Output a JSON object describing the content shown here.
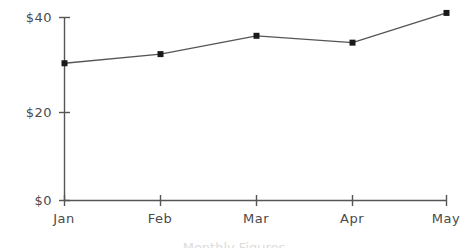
{
  "chart_data": {
    "type": "line",
    "title": "",
    "subtitle": "",
    "xlabel": "",
    "ylabel": "",
    "categories": [
      "Jan",
      "Feb",
      "Mar",
      "Apr",
      "May"
    ],
    "values": [
      30,
      32,
      36,
      34.5,
      41
    ],
    "series": [
      {
        "name": "",
        "values": [
          30,
          32,
          36,
          34.5,
          41
        ]
      }
    ],
    "ylim": [
      0,
      44
    ],
    "y_ticks": [
      0,
      20,
      40
    ],
    "y_tick_labels": [
      "$0",
      "$20",
      "$40"
    ],
    "x_tick_labels": [
      "Jan",
      "Feb",
      "Mar",
      "Apr",
      "May"
    ],
    "grid": false,
    "legend": false,
    "legend_position": "none",
    "marker": "square",
    "line_color": "#555555",
    "marker_color": "#1a1a1a",
    "axis_color": "#555555",
    "text_color": "#4a4a4a",
    "background_color": "#ffffff",
    "annotations": []
  },
  "caption": {
    "text": "Monthly Figures",
    "visible": "clipped"
  }
}
